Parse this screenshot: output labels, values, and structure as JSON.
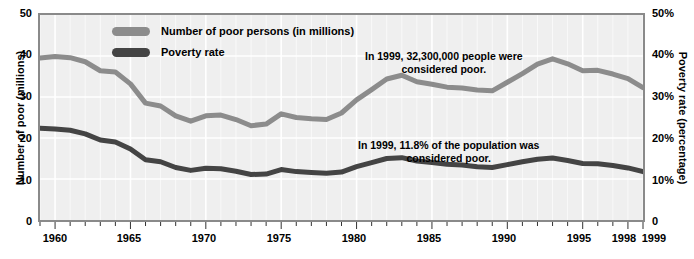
{
  "axes": {
    "y_left_title": "Number of poor (millions)",
    "y_right_title": "Poverty rate (percentage)",
    "y_left_ticks": [
      "50",
      "40",
      "30",
      "20",
      "10",
      "0"
    ],
    "y_right_ticks": [
      "50%",
      "40%",
      "30%",
      "20%",
      "10%",
      "0"
    ],
    "x_ticks": [
      "1960",
      "1965",
      "1970",
      "1975",
      "1980",
      "1985",
      "1990",
      "1995",
      "1998",
      "1999"
    ]
  },
  "legend": {
    "items": [
      {
        "label": "Number of poor persons (in millions)",
        "color": "#8c8c8c"
      },
      {
        "label": "Poverty rate",
        "color": "#444444"
      }
    ]
  },
  "annotations": {
    "persons_line1": "In 1999, 32,300,000 people were",
    "persons_line2": "considered poor.",
    "rate_line1": "In 1999, 11.8% of the population was",
    "rate_line2": "considered poor."
  },
  "colors": {
    "plot_background": "#efefef",
    "grid": "#ffffff",
    "frame": "#8a8a8a",
    "persons_series": "#8c8c8c",
    "rate_series": "#444444",
    "text": "#000000"
  },
  "chart_data": {
    "type": "line",
    "title": "",
    "xlabel": "",
    "ylabel": "Number of poor (millions)",
    "y2label": "Poverty rate (percentage)",
    "xlim": [
      1959,
      1999
    ],
    "ylim": [
      0,
      50
    ],
    "y2lim": [
      0,
      50
    ],
    "grid": true,
    "legend_position": "top-center",
    "x": [
      1959,
      1960,
      1961,
      1962,
      1963,
      1964,
      1965,
      1966,
      1967,
      1968,
      1969,
      1970,
      1971,
      1972,
      1973,
      1974,
      1975,
      1976,
      1977,
      1978,
      1979,
      1980,
      1981,
      1982,
      1983,
      1984,
      1985,
      1986,
      1987,
      1988,
      1989,
      1990,
      1991,
      1992,
      1993,
      1994,
      1995,
      1996,
      1997,
      1998,
      1999
    ],
    "series": [
      {
        "name": "Number of poor persons (in millions)",
        "axis": "left",
        "units": "millions",
        "color": "#8c8c8c",
        "values": [
          39.5,
          39.9,
          39.6,
          38.6,
          36.4,
          36.1,
          33.2,
          28.5,
          27.8,
          25.4,
          24.1,
          25.4,
          25.6,
          24.5,
          23.0,
          23.4,
          25.9,
          25.0,
          24.7,
          24.5,
          26.1,
          29.3,
          31.8,
          34.4,
          35.3,
          33.7,
          33.1,
          32.4,
          32.2,
          31.7,
          31.5,
          33.6,
          35.7,
          38.0,
          39.3,
          38.1,
          36.4,
          36.5,
          35.6,
          34.5,
          32.3
        ]
      },
      {
        "name": "Poverty rate",
        "axis": "right",
        "units": "percent",
        "color": "#444444",
        "values": [
          22.4,
          22.2,
          21.9,
          21.0,
          19.5,
          19.0,
          17.3,
          14.7,
          14.2,
          12.8,
          12.1,
          12.6,
          12.5,
          11.9,
          11.1,
          11.2,
          12.3,
          11.8,
          11.6,
          11.4,
          11.7,
          13.0,
          14.0,
          15.0,
          15.2,
          14.4,
          14.0,
          13.6,
          13.4,
          13.0,
          12.8,
          13.5,
          14.2,
          14.8,
          15.1,
          14.5,
          13.8,
          13.7,
          13.3,
          12.7,
          11.8
        ]
      }
    ]
  }
}
